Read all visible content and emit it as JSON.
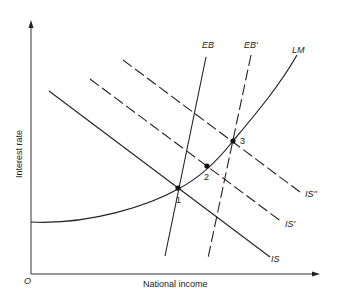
{
  "diagram": {
    "title": "",
    "axes": {
      "x_label": "National income",
      "y_label": "Interest rate",
      "origin_label": "O"
    },
    "curves": [
      {
        "id": "IS",
        "label": "IS",
        "style": "solid",
        "kind": "downward-sloping line"
      },
      {
        "id": "IS1",
        "label": "IS'",
        "style": "dashed",
        "kind": "downward-sloping line"
      },
      {
        "id": "IS2",
        "label": "IS''",
        "style": "dashed",
        "kind": "downward-sloping line"
      },
      {
        "id": "EB",
        "label": "EB",
        "style": "solid",
        "kind": "steep upward line"
      },
      {
        "id": "EB1",
        "label": "EB'",
        "style": "dashed",
        "kind": "steep upward line"
      },
      {
        "id": "LM",
        "label": "LM",
        "style": "solid",
        "kind": "upward convex curve"
      }
    ],
    "points": [
      {
        "id": "p1",
        "label": "1",
        "description": "IS ∩ LM ∩ EB"
      },
      {
        "id": "p2",
        "label": "2",
        "description": "IS' ∩ LM"
      },
      {
        "id": "p3",
        "label": "3",
        "description": "IS'' ∩ LM ∩ EB'"
      }
    ],
    "colors": {
      "ink": "#222222",
      "background": "#ffffff"
    }
  }
}
